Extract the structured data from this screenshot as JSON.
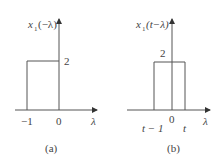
{
  "figures": [
    {
      "id": "a",
      "caption": "(a)",
      "ylabel": "x₁(−λ)",
      "ylabel_main": "x",
      "ylabel_sub": "1",
      "ylabel_arg": "(−λ)",
      "xlabel": "λ",
      "height_label": "2",
      "ticks": [
        "−1",
        "0"
      ],
      "pulse": {
        "start": -1,
        "end": 0,
        "height": 2
      }
    },
    {
      "id": "b",
      "caption": "(b)",
      "ylabel": "x₁(t−λ)",
      "ylabel_main": "x",
      "ylabel_sub": "1",
      "ylabel_arg": "(t−λ)",
      "xlabel": "λ",
      "height_label": "2",
      "ticks": [
        "t − 1",
        "0",
        "t"
      ],
      "pulse": {
        "start": "t-1",
        "end": "t",
        "height": 2
      }
    }
  ],
  "colors": {
    "line": "#555555",
    "text": "#444444"
  }
}
